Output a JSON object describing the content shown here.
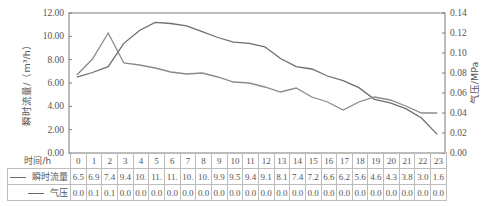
{
  "chart_data": {
    "type": "line",
    "title": "",
    "xlabel": "时间/h",
    "ylabel": "瞬时流量/（m³/h）",
    "y2label": "气压/MPa",
    "ylim": [
      0,
      12
    ],
    "y2lim": [
      0,
      0.14
    ],
    "yticks": [
      "0.00",
      "2.00",
      "4.00",
      "6.00",
      "8.00",
      "10.00",
      "12.00"
    ],
    "y2ticks": [
      "0.00",
      "0.02",
      "0.04",
      "0.06",
      "0.08",
      "0.10",
      "0.12",
      "0.14"
    ],
    "grid": false,
    "legend_position": "table-left",
    "categories": [
      "0",
      "1",
      "2",
      "3",
      "4",
      "5",
      "6",
      "7",
      "8",
      "9",
      "10",
      "11",
      "12",
      "13",
      "14",
      "15",
      "16",
      "17",
      "18",
      "19",
      "20",
      "21",
      "22",
      "23"
    ],
    "series": [
      {
        "name": "瞬时流量",
        "axis": "left",
        "values": [
          6.5,
          6.9,
          7.4,
          9.4,
          10.5,
          11.2,
          11.1,
          10.9,
          10.4,
          9.9,
          9.5,
          9.4,
          9.1,
          8.1,
          7.4,
          7.2,
          6.6,
          6.2,
          5.6,
          4.6,
          4.3,
          3.8,
          3.0,
          1.6
        ],
        "table_labels": [
          "6.5",
          "6.9",
          "7.4",
          "9.4",
          "10.",
          "11.",
          "11.",
          "10.",
          "10.",
          "9.9",
          "9.5",
          "9.4",
          "9.1",
          "8.1",
          "7.4",
          "7.2",
          "6.6",
          "6.2",
          "5.6",
          "4.6",
          "4.3",
          "3.8",
          "3.0",
          "1.6"
        ]
      },
      {
        "name": "气压",
        "axis": "right",
        "values": [
          0.078,
          0.094,
          0.12,
          0.09,
          0.088,
          0.085,
          0.081,
          0.079,
          0.08,
          0.076,
          0.071,
          0.07,
          0.066,
          0.061,
          0.065,
          0.056,
          0.051,
          0.043,
          0.051,
          0.056,
          0.053,
          0.047,
          0.04,
          0.04
        ],
        "table_labels": [
          "0.0",
          "0.1",
          "0.1",
          "0.0",
          "0.0",
          "0.0",
          "0.0",
          "0.0",
          "0.0",
          "0.0",
          "0.0",
          "0.0",
          "0.0",
          "0.0",
          "0.0",
          "0.0",
          "0.0",
          "0.0",
          "0.0",
          "0.0",
          "0.0",
          "0.0",
          "0.0",
          "0.0"
        ]
      }
    ]
  },
  "table": {
    "header_label": "时间/h",
    "row1_label": "瞬时流量",
    "row2_label": "气压"
  },
  "colors": {
    "line": "#6e6e6e",
    "axis": "#7a7a7a",
    "table_border": "#bdbdbd"
  }
}
